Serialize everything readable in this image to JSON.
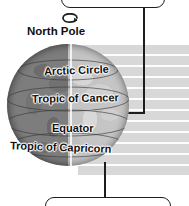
{
  "diagram": {
    "background_color": "#ffffff",
    "globe": {
      "name": "earth-globe",
      "lit_side": "right",
      "shadow_side": "left",
      "base_color": "#a9a9a9",
      "shade_color": "#7d7d7d",
      "axis_label": "rotation-axis"
    },
    "rotation_arrow": {
      "name": "rotation-arrow-icon",
      "direction": "counterclockwise-from-above"
    },
    "labels": {
      "north_pole": "North Pole",
      "arctic_circle": "Arctic Circle",
      "tropic_of_cancer": "Tropic of Cancer",
      "equator": "Equator",
      "tropic_of_capricorn": "Tropic of Capricorn"
    },
    "callouts": {
      "top": {
        "name": "top-callout-box",
        "text": ""
      },
      "bottom": {
        "name": "bottom-callout-box",
        "text": ""
      }
    },
    "leader_lines": [
      {
        "name": "leader-line-to-globe-edge",
        "from": "top-callout-box",
        "to": "globe-right-edge"
      },
      {
        "name": "leader-line-to-bottom-callout",
        "from": "globe-bottom",
        "to": "bottom-callout-box"
      }
    ],
    "paper_band": {
      "name": "lined-paper-band",
      "color": "#d8d8d8",
      "rule_color": "#ffffff"
    },
    "line_color": "#1d1d1d",
    "text_color": "#111111"
  }
}
